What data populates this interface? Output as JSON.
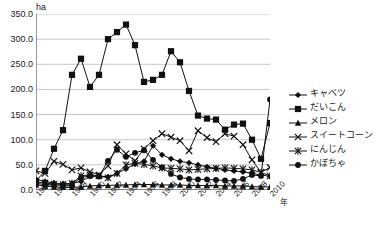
{
  "chart_data": {
    "type": "line",
    "title": "",
    "subtitle": "",
    "xlabel": "年",
    "ylabel": "ha",
    "unit_label": "ha",
    "grid": true,
    "legend_position": "right",
    "ylim": [
      0,
      350
    ],
    "ytick_labels": [
      "350.0",
      "300.0",
      "250.0",
      "200.0",
      "150.0",
      "100.0",
      "50.0",
      "0.0"
    ],
    "ytick_values": [
      350,
      300,
      250,
      200,
      150,
      100,
      50,
      0
    ],
    "x": [
      1984,
      1985,
      1986,
      1987,
      1988,
      1989,
      1990,
      1991,
      1992,
      1993,
      1994,
      1995,
      1996,
      1997,
      1998,
      1999,
      2000,
      2001,
      2002,
      2003,
      2004,
      2005,
      2006,
      2007,
      2008,
      2009,
      2010
    ],
    "xtick_labels": [
      "1984",
      "1986",
      "1988",
      "1990",
      "1992",
      "1994",
      "1996",
      "1998",
      "2000",
      "2002",
      "2004",
      "2006",
      "2008",
      "2010"
    ],
    "xtick_values": [
      1984,
      1986,
      1988,
      1990,
      1992,
      1994,
      1996,
      1998,
      2000,
      2002,
      2004,
      2006,
      2008,
      2010
    ],
    "series": [
      {
        "name": "キャベツ",
        "marker": "diamond",
        "color": "#111111",
        "values": [
          21,
          17,
          14,
          12,
          13,
          17,
          27,
          28,
          26,
          33,
          42,
          52,
          57,
          88,
          70,
          62,
          57,
          54,
          50,
          46,
          43,
          40,
          38,
          36,
          33,
          30,
          27
        ]
      },
      {
        "name": "だいこん",
        "marker": "square",
        "color": "#111111",
        "values": [
          18,
          38,
          82,
          119,
          229,
          261,
          205,
          229,
          300,
          314,
          329,
          288,
          215,
          219,
          229,
          276,
          254,
          197,
          148,
          142,
          140,
          120,
          130,
          132,
          100,
          62,
          133
        ]
      },
      {
        "name": "メロン",
        "marker": "triangle",
        "color": "#111111",
        "values": [
          10,
          8,
          6,
          5,
          5,
          6,
          8,
          9,
          9,
          10,
          10,
          11,
          11,
          11,
          10,
          10,
          10,
          9,
          9,
          9,
          9,
          8,
          8,
          8,
          7,
          6,
          6
        ]
      },
      {
        "name": "スイートコーン",
        "marker": "x",
        "color": "#111111",
        "values": [
          38,
          33,
          57,
          51,
          40,
          44,
          36,
          30,
          48,
          90,
          72,
          58,
          82,
          98,
          112,
          105,
          98,
          78,
          118,
          104,
          96,
          112,
          107,
          90,
          60,
          35,
          45
        ]
      },
      {
        "name": "にんじん",
        "marker": "asterisk",
        "color": "#111111",
        "values": [
          16,
          14,
          12,
          11,
          13,
          28,
          30,
          28,
          24,
          33,
          50,
          53,
          51,
          48,
          44,
          43,
          42,
          40,
          41,
          42,
          43,
          44,
          43,
          42,
          40,
          35,
          28
        ]
      },
      {
        "name": "かぼちゃ",
        "marker": "circle",
        "color": "#111111",
        "values": [
          13,
          11,
          10,
          9,
          10,
          25,
          28,
          27,
          58,
          80,
          66,
          74,
          79,
          60,
          45,
          32,
          25,
          22,
          21,
          21,
          20,
          19,
          18,
          22,
          30,
          28,
          180
        ]
      }
    ]
  },
  "axes": {
    "x_unit_suffix": "年",
    "y_unit": "ha"
  },
  "legend": {
    "items": [
      {
        "label": "キャベツ",
        "marker": "diamond"
      },
      {
        "label": "だいこん",
        "marker": "square"
      },
      {
        "label": "メロン",
        "marker": "triangle"
      },
      {
        "label": "スイートコーン",
        "marker": "x"
      },
      {
        "label": "にんじん",
        "marker": "asterisk"
      },
      {
        "label": "かぼちゃ",
        "marker": "circle"
      }
    ]
  },
  "colors": {
    "line": "#111111",
    "grid": "#b9b9b9",
    "axis": "#333333",
    "background": "#ffffff",
    "text": "#1a1a1a"
  }
}
